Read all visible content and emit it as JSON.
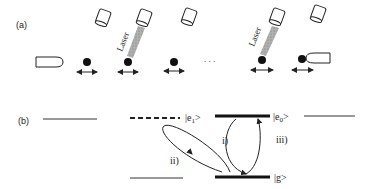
{
  "panel_a": {
    "label": "(a)",
    "laser_label": "Laser",
    "ellipsis": ". . .",
    "ions": [
      {
        "x": 87,
        "y": 62
      },
      {
        "x": 128,
        "y": 62
      },
      {
        "x": 174,
        "y": 62
      },
      {
        "x": 262,
        "y": 60
      },
      {
        "x": 302,
        "y": 59
      }
    ],
    "lasers_active": [
      1,
      3
    ]
  },
  "panel_b": {
    "label": "(b)",
    "states": {
      "e1": "|e",
      "e1_sub": "1",
      "e1_close": ">",
      "e0": "|e",
      "e0_sub": "0",
      "e0_close": ">",
      "g": "|g>"
    },
    "transitions": {
      "i": "i)",
      "ii": "ii)",
      "iii": "iii)"
    }
  },
  "colors": {
    "ink": "#222222",
    "laser_beam": "#9a9a9a"
  }
}
